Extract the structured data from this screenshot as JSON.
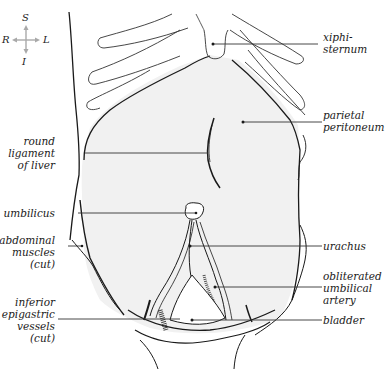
{
  "figure": {
    "colors": {
      "cavity_fill": "#f1f1f1",
      "line": "#1a1a1a",
      "leader": "#333333",
      "compass": "#a9a9a9",
      "background": "#ffffff"
    }
  },
  "compass": {
    "superior": "S",
    "inferior": "I",
    "right": "R",
    "left": "L"
  },
  "labels": {
    "xiphisternum": {
      "lines": [
        "xiphi-",
        "sternum"
      ]
    },
    "parietal_peritoneum": {
      "lines": [
        "parietal",
        "peritoneum"
      ]
    },
    "round_ligament": {
      "lines": [
        "round",
        "ligament",
        "of liver"
      ]
    },
    "umbilicus": {
      "lines": [
        "umbilicus"
      ]
    },
    "abdominal_muscles": {
      "lines": [
        "abdominal",
        "muscles",
        "(cut)"
      ]
    },
    "urachus": {
      "lines": [
        "urachus"
      ]
    },
    "obliterated_artery": {
      "lines": [
        "obliterated",
        "umbilical",
        "artery"
      ]
    },
    "inferior_epigastric": {
      "lines": [
        "inferior",
        "epigastric",
        "vessels",
        "(cut)"
      ]
    },
    "bladder": {
      "lines": [
        "bladder"
      ]
    }
  }
}
